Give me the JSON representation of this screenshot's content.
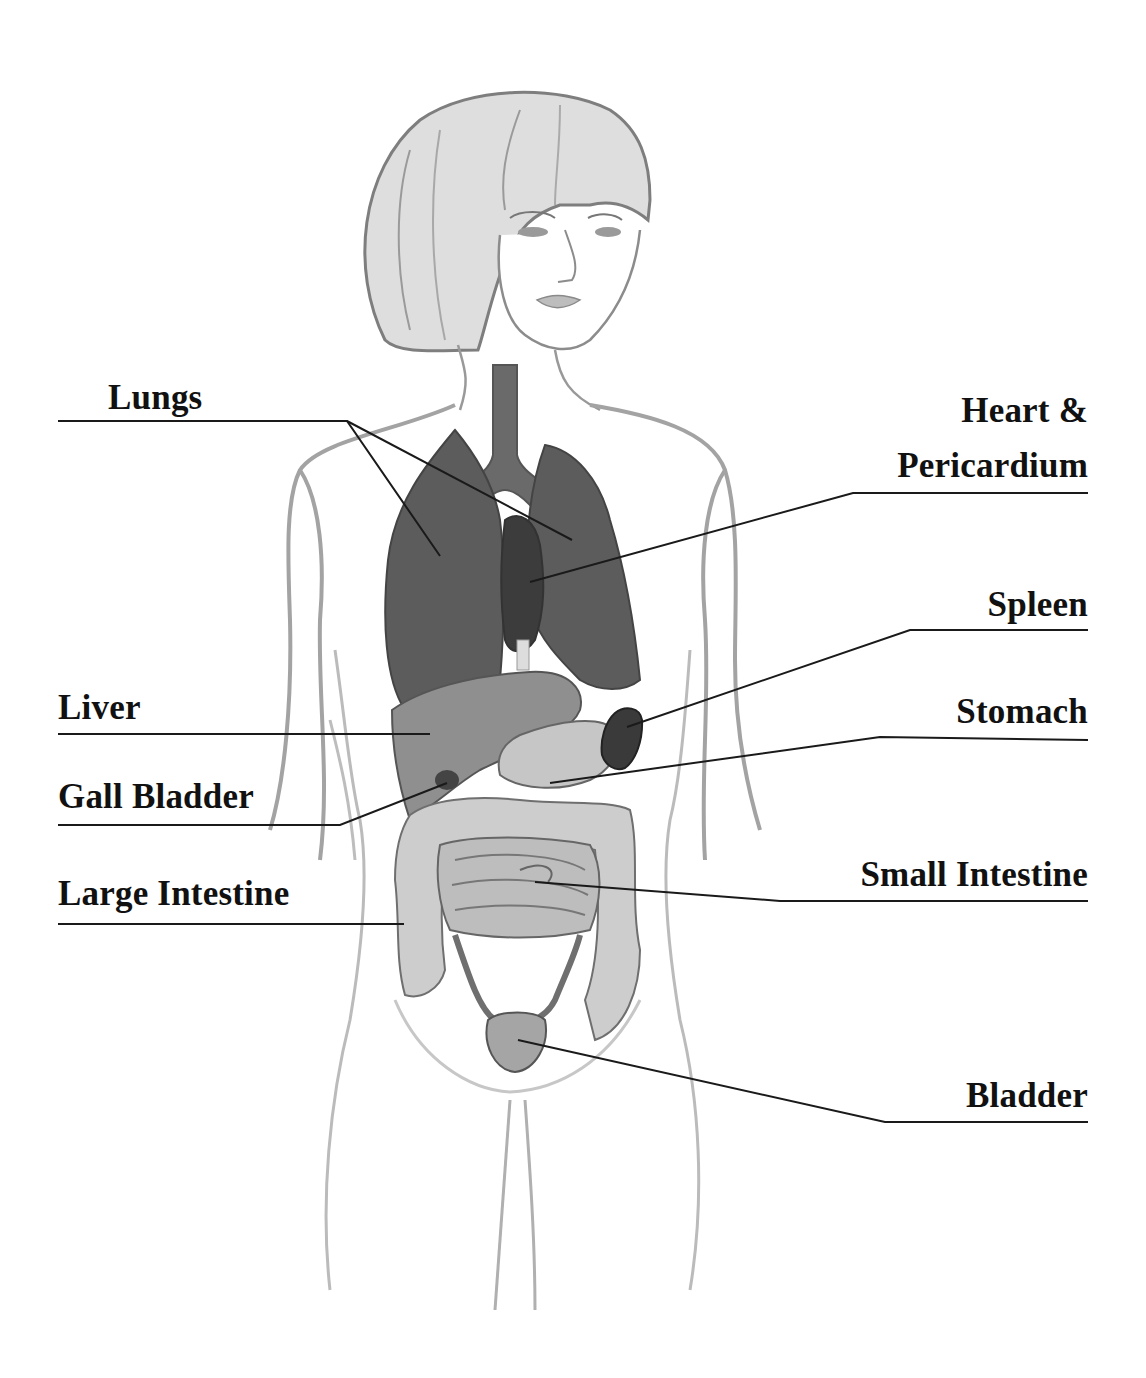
{
  "diagram": {
    "type": "anatomical-illustration",
    "colors": {
      "background": "#ffffff",
      "label_text": "#111111",
      "leader_line": "#1a1a1a",
      "outline": "#8a8a8a",
      "lungs_fill": "#5c5c5c",
      "heart_fill": "#3e3e3e",
      "liver_fill": "#8f8f8f",
      "stomach_fill": "#c6c6c6",
      "spleen_fill": "#3a3a3a",
      "gallbladder_fill": "#444444",
      "intestine_fill": "#c9c9c9",
      "bladder_fill": "#a5a5a5"
    },
    "labels": {
      "lungs": "Lungs",
      "heart_line1": "Heart &",
      "heart_line2": "Pericardium",
      "spleen": "Spleen",
      "liver": "Liver",
      "stomach": "Stomach",
      "gall_bladder": "Gall Bladder",
      "small_intestine": "Small Intestine",
      "large_intestine": "Large Intestine",
      "bladder": "Bladder"
    }
  }
}
